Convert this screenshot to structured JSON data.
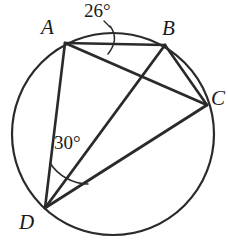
{
  "figure": {
    "kind": "circle-inscribed-quadrilateral-diagram",
    "colors": {
      "stroke": "#2a2a2a",
      "text": "#1a1a1a",
      "background": "#ffffff"
    },
    "circle": {
      "center_x": 113,
      "center_y": 134,
      "radius": 101,
      "stroke_width": 2.2
    },
    "points": [
      {
        "id": "A",
        "label": "A",
        "x": 65,
        "y": 43
      },
      {
        "id": "B",
        "label": "B",
        "x": 165,
        "y": 45
      },
      {
        "id": "C",
        "label": "C",
        "x": 207,
        "y": 105
      },
      {
        "id": "D",
        "label": "D",
        "x": 45,
        "y": 208
      }
    ],
    "chords": [
      {
        "id": "AB",
        "from": "A",
        "to": "B",
        "x1": 65,
        "y1": 43,
        "x2": 165,
        "y2": 45
      },
      {
        "id": "AC",
        "from": "A",
        "to": "C",
        "x1": 65,
        "y1": 43,
        "x2": 207,
        "y2": 105
      },
      {
        "id": "AD",
        "from": "A",
        "to": "D",
        "x1": 65,
        "y1": 43,
        "x2": 45,
        "y2": 208
      },
      {
        "id": "BC",
        "from": "B",
        "to": "C",
        "x1": 165,
        "y1": 45,
        "x2": 207,
        "y2": 105
      },
      {
        "id": "BD",
        "from": "B",
        "to": "D",
        "x1": 165,
        "y1": 45,
        "x2": 45,
        "y2": 208
      },
      {
        "id": "CD",
        "from": "C",
        "to": "D",
        "x1": 207,
        "y1": 105,
        "x2": 45,
        "y2": 208
      }
    ],
    "angles": [
      {
        "id": "angle-26",
        "label": "26°",
        "value": 26,
        "unit": "degrees",
        "vertex": "A",
        "between": [
          "AB",
          "AC"
        ],
        "marker_path": "M 110 26 C 116 34, 116 44, 108 54",
        "leader_path": "M 104 21 L 110 27"
      },
      {
        "id": "angle-30",
        "label": "30°",
        "value": 30,
        "unit": "degrees",
        "vertex": "D",
        "between": [
          "DA",
          "DB"
        ],
        "marker_path": "M 50 163 A 46 46 0 0 0 88 184"
      }
    ]
  }
}
